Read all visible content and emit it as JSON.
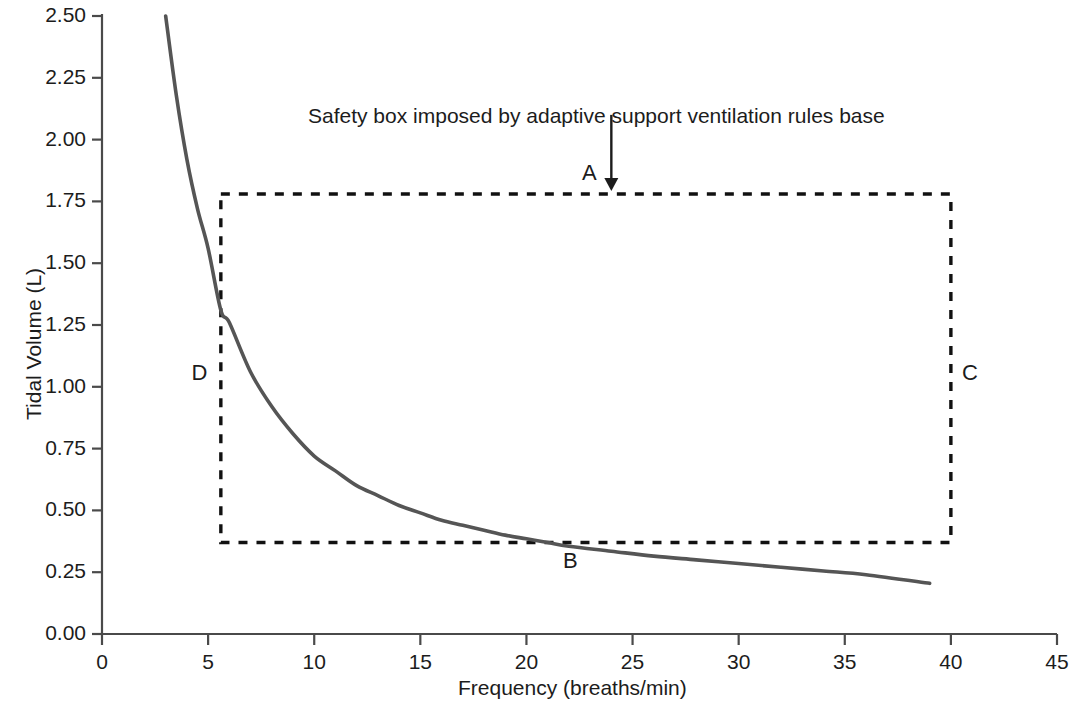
{
  "chart_data": {
    "type": "line",
    "title": "",
    "xlabel": "Frequency (breaths/min)",
    "ylabel": "Tidal Volume (L)",
    "xlim": [
      0,
      45
    ],
    "ylim": [
      0.0,
      2.5
    ],
    "grid": false,
    "legend": null,
    "x_ticks": [
      "0",
      "5",
      "10",
      "15",
      "20",
      "25",
      "30",
      "35",
      "40",
      "45"
    ],
    "y_ticks": [
      "0.00",
      "0.25",
      "0.50",
      "0.75",
      "1.00",
      "1.25",
      "1.50",
      "1.75",
      "2.00",
      "2.25",
      "2.50"
    ],
    "series": [
      {
        "name": "Minute ventilation isopleth",
        "style": "solid",
        "color": "#555555",
        "x": [
          3.0,
          3.5,
          4.0,
          4.5,
          5.0,
          5.6,
          6.0,
          7.0,
          8.0,
          9.0,
          10.0,
          11.0,
          12.0,
          13.0,
          14.0,
          15.0,
          16.0,
          17.0,
          18.0,
          19.0,
          20.0,
          21.0,
          22.0,
          24.0,
          26.0,
          28.0,
          30.0,
          32.0,
          34.0,
          36.0,
          39.0
        ],
        "y": [
          2.5,
          2.18,
          1.92,
          1.72,
          1.56,
          1.31,
          1.26,
          1.06,
          0.92,
          0.81,
          0.72,
          0.66,
          0.6,
          0.56,
          0.52,
          0.49,
          0.46,
          0.44,
          0.42,
          0.4,
          0.385,
          0.37,
          0.355,
          0.335,
          0.315,
          0.3,
          0.285,
          0.27,
          0.255,
          0.24,
          0.205
        ]
      }
    ],
    "annotations": [
      {
        "name": "safety-box-note",
        "text": "Safety box imposed by adaptive support ventilation rules base",
        "arrow": {
          "from_x": 24.0,
          "from_y": 2.1,
          "to_x": 24.0,
          "to_y": 1.8
        }
      }
    ],
    "safety_box": {
      "label": "Safety box",
      "x_min": 5.6,
      "x_max": 40.0,
      "y_min": 0.37,
      "y_max": 1.78,
      "style": "dashed",
      "color": "#111111"
    },
    "point_labels": [
      {
        "label": "A",
        "x": 23.0,
        "y": 1.86,
        "desc": "top-edge-label"
      },
      {
        "label": "B",
        "x": 22.1,
        "y": 0.29,
        "desc": "bottom-edge-label"
      },
      {
        "label": "C",
        "x": 40.9,
        "y": 1.05,
        "desc": "right-edge-label"
      },
      {
        "label": "D",
        "x": 4.6,
        "y": 1.05,
        "desc": "left-edge-label"
      }
    ]
  },
  "colors": {
    "axis": "#4a4a4a",
    "curve": "#555555",
    "box": "#111111",
    "text": "#1c1c1c",
    "background": "#ffffff"
  }
}
